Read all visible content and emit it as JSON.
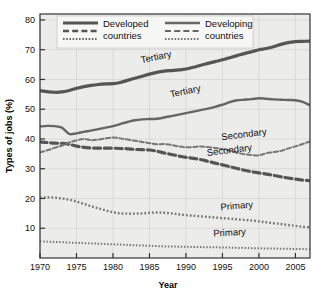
{
  "chart_data": {
    "type": "line",
    "title": "",
    "xlabel": "Year",
    "ylabel": "Types of jobs (%)",
    "xlim": [
      1970,
      2007
    ],
    "ylim": [
      0,
      82
    ],
    "yticks": [
      10,
      20,
      30,
      40,
      50,
      60,
      70,
      80
    ],
    "xticks": [
      1970,
      1975,
      1980,
      1985,
      1990,
      1995,
      2000,
      2005
    ],
    "grid": true,
    "legend_position": "top-inside",
    "x": [
      1970,
      1971,
      1972,
      1973,
      1974,
      1975,
      1976,
      1977,
      1978,
      1979,
      1980,
      1981,
      1982,
      1983,
      1984,
      1985,
      1986,
      1987,
      1988,
      1989,
      1990,
      1991,
      1992,
      1993,
      1994,
      1995,
      1996,
      1997,
      1998,
      1999,
      2000,
      2001,
      2002,
      2003,
      2004,
      2005,
      2006,
      2007
    ],
    "series": [
      {
        "name": "Tertiary",
        "group": "Developed countries",
        "style": "solid",
        "width": "thick",
        "color": "#555555",
        "values": [
          56.2,
          55.9,
          55.7,
          55.8,
          56.3,
          57.0,
          57.6,
          58.0,
          58.3,
          58.5,
          58.6,
          59.0,
          59.7,
          60.4,
          61.1,
          61.8,
          62.4,
          62.8,
          63.0,
          63.2,
          63.5,
          64.1,
          64.8,
          65.4,
          66.0,
          66.6,
          67.3,
          68.0,
          68.7,
          69.3,
          70.0,
          70.4,
          71.0,
          71.8,
          72.4,
          72.7,
          72.8,
          72.9
        ]
      },
      {
        "name": "Tertiary",
        "group": "Developing countries",
        "style": "solid",
        "width": "medium",
        "color": "#666666",
        "values": [
          44.2,
          44.4,
          44.3,
          43.8,
          41.7,
          41.9,
          42.4,
          42.8,
          43.3,
          43.8,
          44.3,
          45.0,
          45.7,
          46.3,
          46.6,
          46.7,
          46.8,
          47.2,
          47.7,
          48.2,
          48.7,
          49.2,
          49.7,
          50.2,
          50.8,
          51.5,
          52.4,
          53.0,
          53.2,
          53.4,
          53.7,
          53.5,
          53.3,
          53.2,
          53.1,
          53.0,
          52.5,
          51.3
        ]
      },
      {
        "name": "Secondary",
        "group": "Developed countries",
        "style": "dashed",
        "width": "thick",
        "color": "#555555",
        "values": [
          39.0,
          38.8,
          38.6,
          38.5,
          38.2,
          37.6,
          37.2,
          37.0,
          36.9,
          36.9,
          36.9,
          36.8,
          36.7,
          36.5,
          36.4,
          36.3,
          35.9,
          35.3,
          34.8,
          34.3,
          33.8,
          33.5,
          33.1,
          32.5,
          31.9,
          31.3,
          30.7,
          30.1,
          29.5,
          29.0,
          28.6,
          28.2,
          27.8,
          27.3,
          26.9,
          26.5,
          26.2,
          26.0
        ]
      },
      {
        "name": "Secondary",
        "group": "Developing countries",
        "style": "dashed",
        "width": "thin",
        "color": "#777777",
        "values": [
          35.5,
          36.2,
          37.0,
          37.8,
          38.8,
          39.5,
          40.0,
          39.6,
          39.8,
          40.2,
          40.5,
          40.2,
          39.8,
          39.4,
          39.0,
          38.6,
          38.2,
          38.3,
          38.0,
          37.5,
          37.2,
          37.3,
          37.5,
          37.3,
          37.0,
          36.6,
          36.1,
          35.4,
          34.9,
          34.6,
          34.5,
          35.2,
          35.6,
          36.0,
          36.8,
          37.5,
          38.3,
          39.2
        ]
      },
      {
        "name": "Primary",
        "group": "Developing countries",
        "style": "dotted",
        "width": "medium",
        "color": "#777777",
        "values": [
          20.3,
          20.4,
          20.3,
          20.0,
          19.6,
          19.0,
          18.2,
          17.4,
          16.7,
          16.0,
          15.4,
          15.0,
          14.9,
          14.9,
          15.0,
          15.2,
          15.3,
          15.2,
          15.0,
          14.7,
          14.4,
          14.2,
          14.0,
          13.8,
          13.6,
          13.4,
          13.2,
          13.0,
          12.8,
          12.6,
          12.3,
          12.0,
          11.7,
          11.4,
          11.1,
          10.8,
          10.5,
          10.3
        ]
      },
      {
        "name": "Primary",
        "group": "Developed countries",
        "style": "dotted",
        "width": "thin",
        "color": "#777777",
        "values": [
          5.6,
          5.5,
          5.4,
          5.3,
          5.2,
          5.1,
          5.0,
          4.9,
          4.8,
          4.7,
          4.6,
          4.5,
          4.4,
          4.3,
          4.2,
          4.1,
          4.0,
          3.9,
          3.9,
          3.8,
          3.8,
          3.7,
          3.7,
          3.6,
          3.6,
          3.5,
          3.5,
          3.4,
          3.4,
          3.3,
          3.3,
          3.2,
          3.2,
          3.1,
          3.1,
          3.0,
          3.0,
          2.9
        ]
      }
    ],
    "annotations": [
      {
        "text": "Tertiary",
        "x": 1986,
        "y": 66.5,
        "rotate": -12
      },
      {
        "text": "Tertiary",
        "x": 1990,
        "y": 55.0,
        "rotate": -12
      },
      {
        "text": "Secondary",
        "x": 1998,
        "y": 40.5,
        "rotate": -7
      },
      {
        "text": "Secondary",
        "x": 1996,
        "y": 35.2,
        "rotate": -7
      },
      {
        "text": "Primary",
        "x": 1997,
        "y": 16.5,
        "rotate": -5
      },
      {
        "text": "Primary",
        "x": 1996,
        "y": 7.5,
        "rotate": -3
      }
    ]
  },
  "legend": {
    "columns": [
      {
        "label_line1": "Developed",
        "label_line2": "countries"
      },
      {
        "label_line1": "Developing",
        "label_line2": "countries"
      }
    ]
  },
  "axes": {
    "xlabel": "Year",
    "ylabel": "Types of jobs (%)",
    "ytick_labels": [
      "80",
      "70",
      "60",
      "50",
      "40",
      "30",
      "20",
      "10"
    ],
    "xtick_labels": [
      "1970",
      "1975",
      "1980",
      "1985",
      "1990",
      "1995",
      "2000",
      "2005"
    ]
  }
}
